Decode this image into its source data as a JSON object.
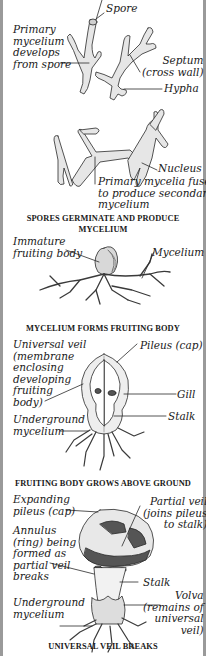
{
  "diagram": {
    "panels": [
      {
        "id": "spores-germinate",
        "caption": "SPORES GERMINATE AND PRODUCE\nMYCELIUM",
        "labels": {
          "spore": "Spore",
          "primary_mycelium": "Primary\nmycelium\ndevelops\nfrom spore",
          "septum": "Septum\n(cross wall)",
          "hypha": "Hypha",
          "nucleus": "Nucleus",
          "primary_mycelia_fuse": "Primary mycelia fuse\nto produce secondary\nmycelium"
        }
      },
      {
        "id": "fruiting-body-forms",
        "caption": "MYCELIUM FORMS FRUITING BODY",
        "labels": {
          "immature_fruiting_body": "Immature\nfruiting body",
          "mycelium": "Mycelium"
        }
      },
      {
        "id": "grows-above-ground",
        "caption": "FRUITING BODY GROWS ABOVE GROUND",
        "labels": {
          "universal_veil": "Universal veil\n(membrane\nenclosing\ndeveloping\nfruiting\nbody)",
          "pileus": "Pileus (cap)",
          "gill": "Gill",
          "underground_mycelium": "Underground\nmycelium",
          "stalk": "Stalk"
        }
      },
      {
        "id": "universal-veil-breaks",
        "caption": "UNIVERSAL VEIL BREAKS",
        "labels": {
          "expanding_pileus": "Expanding\npileus (cap)",
          "partial_veil": "Partial veil\n(joins pileus\nto stalk)",
          "annulus": "Annulus\n(ring) being\nformed as\npartial veil\nbreaks",
          "stalk": "Stalk",
          "underground_mycelium": "Underground\nmycelium",
          "volva": "Volva\n(remains of\nuniversal\nveil)"
        }
      }
    ],
    "colors": {
      "ink": "#1a1a1a",
      "hypha_fill": "#e6e6e6",
      "cap_dark": "#555555",
      "frame": "#9a9a9a",
      "background": "#ffffff"
    }
  }
}
